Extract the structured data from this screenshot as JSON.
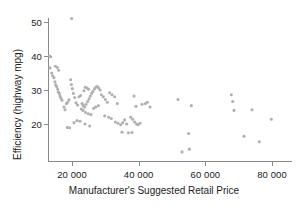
{
  "chart_data": {
    "type": "scatter",
    "title": "",
    "xlabel": "Manufacturer's Suggested Retail Price",
    "ylabel": "Efficiency (highway mpg)",
    "xlim": [
      12000,
      83000
    ],
    "ylim": [
      11,
      53
    ],
    "grid": false,
    "legend": null,
    "marker": {
      "shape": "circle",
      "color": "#b0b0b0",
      "size_px": 3.1
    },
    "xticks": [
      20000,
      40000,
      60000,
      80000
    ],
    "xtick_labels": [
      "20 000",
      "40 000",
      "60 000",
      "80 000"
    ],
    "yticks": [
      20,
      30,
      40,
      50
    ],
    "ytick_labels": [
      "20",
      "30",
      "40",
      "50"
    ],
    "axis_color": "#8a8a8a",
    "text_color": "#1b1b1b",
    "points": [
      [
        13200,
        40.0
      ],
      [
        13600,
        39.8
      ],
      [
        13400,
        36.5
      ],
      [
        13900,
        35.0
      ],
      [
        14200,
        34.2
      ],
      [
        14600,
        33.6
      ],
      [
        14900,
        32.4
      ],
      [
        15100,
        31.5
      ],
      [
        15400,
        31.0
      ],
      [
        15700,
        30.2
      ],
      [
        15900,
        29.4
      ],
      [
        16200,
        29.0
      ],
      [
        16400,
        28.2
      ],
      [
        16700,
        27.6
      ],
      [
        17000,
        27.0
      ],
      [
        15000,
        37.0
      ],
      [
        15600,
        36.6
      ],
      [
        16000,
        35.8
      ],
      [
        19900,
        51.0
      ],
      [
        17600,
        25.0
      ],
      [
        17900,
        24.2
      ],
      [
        18300,
        26.0
      ],
      [
        18700,
        26.4
      ],
      [
        19100,
        27.1
      ],
      [
        19600,
        33.0
      ],
      [
        19800,
        31.6
      ],
      [
        20100,
        30.4
      ],
      [
        20400,
        29.0
      ],
      [
        20800,
        27.8
      ],
      [
        21200,
        26.2
      ],
      [
        21700,
        25.6
      ],
      [
        18600,
        19.0
      ],
      [
        19300,
        18.9
      ],
      [
        20600,
        20.4
      ],
      [
        21500,
        21.0
      ],
      [
        22100,
        28.0
      ],
      [
        22600,
        28.4
      ],
      [
        23000,
        26.0
      ],
      [
        23400,
        25.4
      ],
      [
        23800,
        25.0
      ],
      [
        24200,
        25.8
      ],
      [
        24700,
        26.6
      ],
      [
        25100,
        27.4
      ],
      [
        25500,
        28.2
      ],
      [
        25900,
        29.0
      ],
      [
        26300,
        29.6
      ],
      [
        26800,
        30.4
      ],
      [
        27200,
        30.9
      ],
      [
        27600,
        31.0
      ],
      [
        28000,
        30.6
      ],
      [
        28400,
        30.0
      ],
      [
        24000,
        30.8
      ],
      [
        24500,
        30.6
      ],
      [
        25000,
        30.2
      ],
      [
        23600,
        29.8
      ],
      [
        22800,
        24.4
      ],
      [
        23300,
        24.0
      ],
      [
        24100,
        23.4
      ],
      [
        24900,
        23.0
      ],
      [
        25700,
        22.8
      ],
      [
        26500,
        24.6
      ],
      [
        27100,
        25.0
      ],
      [
        27900,
        25.4
      ],
      [
        22400,
        20.8
      ],
      [
        23900,
        20.0
      ],
      [
        25300,
        19.4
      ],
      [
        28800,
        28.6
      ],
      [
        29400,
        28.0
      ],
      [
        30000,
        27.2
      ],
      [
        30600,
        26.4
      ],
      [
        31300,
        29.2
      ],
      [
        32000,
        28.6
      ],
      [
        32800,
        28.0
      ],
      [
        33600,
        26.0
      ],
      [
        29800,
        22.4
      ],
      [
        31000,
        22.0
      ],
      [
        31800,
        21.6
      ],
      [
        33000,
        20.6
      ],
      [
        33800,
        20.2
      ],
      [
        34600,
        19.8
      ],
      [
        35200,
        20.4
      ],
      [
        35800,
        21.2
      ],
      [
        36400,
        20.0
      ],
      [
        36900,
        17.4
      ],
      [
        35000,
        17.6
      ],
      [
        37600,
        22.0
      ],
      [
        38200,
        21.4
      ],
      [
        38800,
        20.6
      ],
      [
        39400,
        20.0
      ],
      [
        38000,
        17.5
      ],
      [
        39800,
        19.8
      ],
      [
        40400,
        20.2
      ],
      [
        38600,
        28.2
      ],
      [
        39200,
        25.2
      ],
      [
        41000,
        25.8
      ],
      [
        42000,
        26.0
      ],
      [
        42600,
        26.4
      ],
      [
        43400,
        25.0
      ],
      [
        51800,
        27.2
      ],
      [
        53000,
        11.8
      ],
      [
        55200,
        12.6
      ],
      [
        55800,
        25.4
      ],
      [
        55000,
        17.2
      ],
      [
        67800,
        28.6
      ],
      [
        68200,
        26.6
      ],
      [
        68600,
        24.0
      ],
      [
        71600,
        16.4
      ],
      [
        74000,
        24.2
      ],
      [
        76200,
        14.8
      ],
      [
        79800,
        21.4
      ]
    ]
  },
  "axes_geometry": {
    "x_px_at_20000": 72,
    "x_px_at_80000": 272,
    "y_px_at_50": 22,
    "y_px_at_20": 124,
    "plot_left_px": 48,
    "plot_bottom_px": 161,
    "plot_top_px": 18,
    "plot_right_px": 300
  }
}
